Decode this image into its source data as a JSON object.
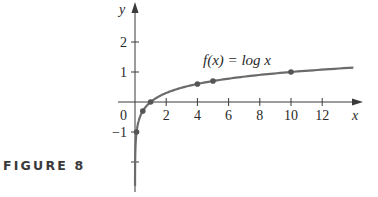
{
  "figure": {
    "caption": "FIGURE 8"
  },
  "chart_data": {
    "type": "line",
    "title": "",
    "function_label": "f(x) = log x",
    "xlabel": "x",
    "ylabel": "y",
    "xlim": [
      -0.5,
      14.5
    ],
    "ylim": [
      -2.8,
      3.2
    ],
    "x_ticks": [
      2,
      4,
      6,
      8,
      10,
      12
    ],
    "x_tick_labels": [
      "2",
      "4",
      "6",
      "8",
      "10",
      "12"
    ],
    "y_ticks": [
      -2,
      -1,
      1,
      2
    ],
    "y_tick_labels": [
      "",
      "−1",
      "1",
      "2"
    ],
    "origin_label": "0",
    "grid": false,
    "legend": null,
    "series": [
      {
        "name": "f(x) = log x",
        "x": [
          0.0016,
          0.01,
          0.05,
          0.1,
          0.2,
          0.5,
          1,
          2,
          3,
          4,
          5,
          6,
          8,
          10,
          12,
          14
        ],
        "y": [
          -2.8,
          -2,
          -1.301,
          -1,
          -0.699,
          -0.301,
          0,
          0.301,
          0.477,
          0.602,
          0.699,
          0.778,
          0.903,
          1,
          1.079,
          1.146
        ]
      }
    ],
    "marked_points": [
      {
        "x": 0.1,
        "y": -1
      },
      {
        "x": 0.5,
        "y": -0.301
      },
      {
        "x": 1,
        "y": 0
      },
      {
        "x": 4,
        "y": 0.602
      },
      {
        "x": 5,
        "y": 0.699
      },
      {
        "x": 10,
        "y": 1
      }
    ]
  },
  "colors": {
    "axis": "#3a3a3a",
    "curve": "#6b6b6b",
    "points": "#555555",
    "text": "#2a2a2a"
  }
}
